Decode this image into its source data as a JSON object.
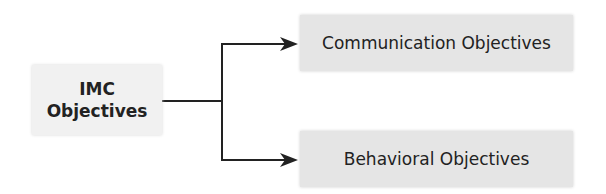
{
  "diagram": {
    "root": {
      "line1": "IMC",
      "line2": "Objectives"
    },
    "children": [
      {
        "label": "Communication Objectives"
      },
      {
        "label": "Behavioral Objectives"
      }
    ],
    "colors": {
      "root_fill": "#f1f1f1",
      "child_fill": "#e5e5e5",
      "connector": "#222222"
    }
  }
}
